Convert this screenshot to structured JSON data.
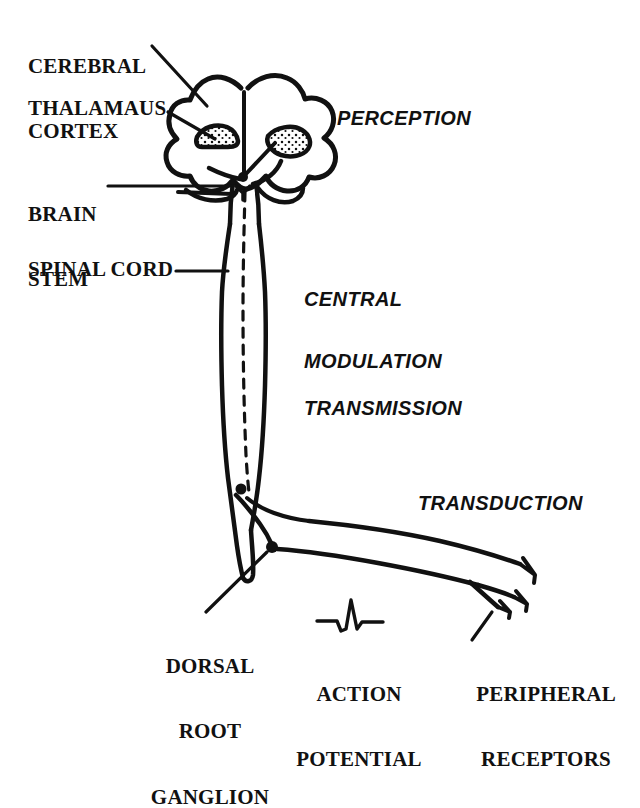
{
  "figure": {
    "background_color": "#ffffff",
    "ink_color": "#111111"
  },
  "anatomy_labels": [
    {
      "id": "cerebral-cortex",
      "line1": "CEREBRAL",
      "line2": "CORTEX"
    },
    {
      "id": "thalamaus",
      "line1": "THALAMAUS",
      "line2": ""
    },
    {
      "id": "brain-stem",
      "line1": "BRAIN",
      "line2": "STEM"
    },
    {
      "id": "spinal-cord",
      "line1": "SPINAL CORD",
      "line2": ""
    },
    {
      "id": "dorsal-root-ganglion",
      "line1": "DORSAL",
      "line2": "ROOT",
      "line3": "GANGLION"
    },
    {
      "id": "action-potential",
      "line1": "ACTION",
      "line2": "POTENTIAL"
    },
    {
      "id": "peripheral-receptors",
      "line1": "PERIPHERAL",
      "line2": "RECEPTORS"
    }
  ],
  "process_labels": [
    {
      "id": "perception",
      "text": "PERCEPTION"
    },
    {
      "id": "central-modulation",
      "line1": "CENTRAL",
      "line2": "MODULATION"
    },
    {
      "id": "transmission",
      "text": "TRANSMISSION"
    },
    {
      "id": "transduction",
      "text": "TRANSDUCTION"
    }
  ],
  "text": {
    "cerebral_cortex_1": "CEREBRAL",
    "cerebral_cortex_2": "CORTEX",
    "thalamaus": "THALAMAUS",
    "brain_stem_1": "BRAIN",
    "brain_stem_2": "STEM",
    "spinal_cord": "SPINAL CORD",
    "dorsal_1": "DORSAL",
    "dorsal_2": "ROOT",
    "dorsal_3": "GANGLION",
    "action_1": "ACTION",
    "action_2": "POTENTIAL",
    "peripheral_1": "PERIPHERAL",
    "peripheral_2": "RECEPTORS",
    "perception": "PERCEPTION",
    "central_modulation_1": "CENTRAL",
    "central_modulation_2": "MODULATION",
    "transmission": "TRANSMISSION",
    "transduction": "TRANSDUCTION"
  }
}
